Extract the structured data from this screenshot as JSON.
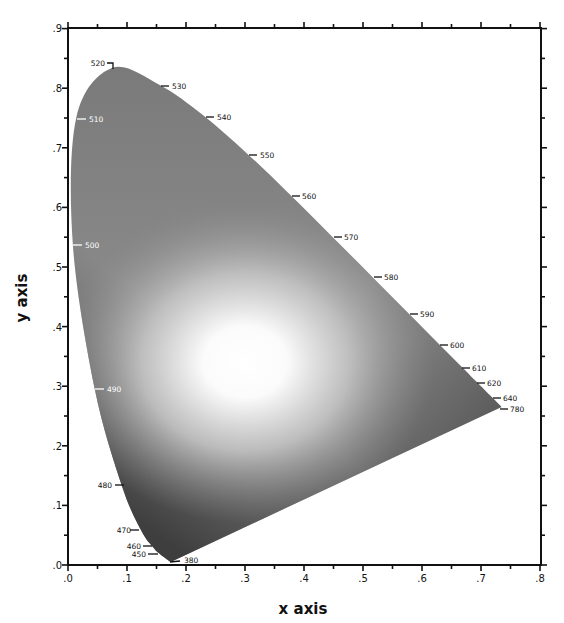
{
  "chart_data": {
    "type": "diagram",
    "title": "",
    "xlabel": "x axis",
    "ylabel": "y axis",
    "xlim": [
      0.0,
      0.8
    ],
    "ylim": [
      0.0,
      0.9
    ],
    "grid": false,
    "x_ticks": [
      ".0",
      ".1",
      ".2",
      ".3",
      ".4",
      ".5",
      ".6",
      ".7",
      ".8"
    ],
    "y_ticks": [
      ".0",
      ".1",
      ".2",
      ".3",
      ".4",
      ".5",
      ".6",
      ".7",
      ".8",
      ".9"
    ],
    "fill": {
      "edge_color": "#6e6e6e",
      "center_color": "#ffffff",
      "center_xy": [
        0.3,
        0.34
      ],
      "dark_corner_color": "#3a3a3a"
    },
    "spectral_locus": [
      {
        "nm": "380",
        "x": 0.1741,
        "y": 0.005
      },
      {
        "nm": "450",
        "x": 0.1566,
        "y": 0.0177
      },
      {
        "nm": "460",
        "x": 0.144,
        "y": 0.0297
      },
      {
        "nm": "470",
        "x": 0.1241,
        "y": 0.0578
      },
      {
        "nm": "480",
        "x": 0.0913,
        "y": 0.1327
      },
      {
        "nm": "490",
        "x": 0.0454,
        "y": 0.295
      },
      {
        "nm": "500",
        "x": 0.0082,
        "y": 0.5384
      },
      {
        "nm": "510",
        "x": 0.0139,
        "y": 0.7502
      },
      {
        "nm": "520",
        "x": 0.0743,
        "y": 0.8338
      },
      {
        "nm": "530",
        "x": 0.1547,
        "y": 0.8059
      },
      {
        "nm": "540",
        "x": 0.2296,
        "y": 0.7543
      },
      {
        "nm": "550",
        "x": 0.3016,
        "y": 0.6923
      },
      {
        "nm": "560",
        "x": 0.3731,
        "y": 0.6245
      },
      {
        "nm": "570",
        "x": 0.4441,
        "y": 0.5547
      },
      {
        "nm": "580",
        "x": 0.5125,
        "y": 0.4866
      },
      {
        "nm": "590",
        "x": 0.5752,
        "y": 0.4242
      },
      {
        "nm": "600",
        "x": 0.627,
        "y": 0.3725
      },
      {
        "nm": "610",
        "x": 0.6658,
        "y": 0.334
      },
      {
        "nm": "620",
        "x": 0.6915,
        "y": 0.3083
      },
      {
        "nm": "640",
        "x": 0.719,
        "y": 0.2809
      },
      {
        "nm": "780",
        "x": 0.7347,
        "y": 0.2653
      }
    ]
  },
  "axes": {
    "x_title": "x axis",
    "y_title": "y axis",
    "x_ticks": [
      ".0",
      ".1",
      ".2",
      ".3",
      ".4",
      ".5",
      ".6",
      ".7",
      ".8"
    ],
    "y_ticks": [
      ".0",
      ".1",
      ".2",
      ".3",
      ".4",
      ".5",
      ".6",
      ".7",
      ".8",
      ".9"
    ]
  },
  "wavelength_labels": {
    "380": "380",
    "450": "450",
    "460": "460",
    "470": "470",
    "480": "480",
    "490": "490",
    "500": "500",
    "510": "510",
    "520": "520",
    "530": "530",
    "540": "540",
    "550": "550",
    "560": "560",
    "570": "570",
    "580": "580",
    "590": "590",
    "600": "600",
    "610": "610",
    "620": "620",
    "640": "640",
    "780": "780"
  },
  "colors": {
    "axis": "#111111",
    "locus_edge": "#6e6e6e",
    "center_white": "#ffffff"
  }
}
